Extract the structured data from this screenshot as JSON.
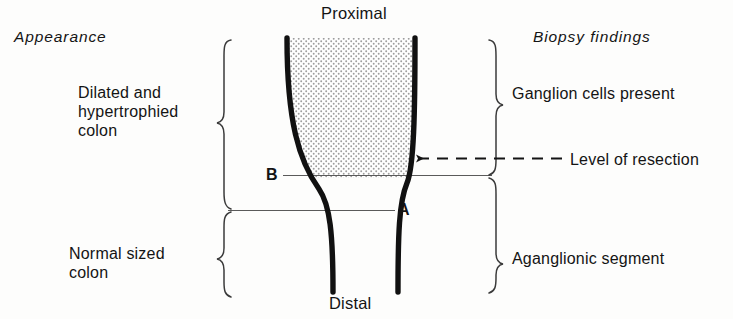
{
  "diagram": {
    "columns": {
      "left_header": "Appearance",
      "right_header": "Biopsy findings"
    },
    "orientation": {
      "top": "Proximal",
      "bottom": "Distal"
    },
    "left_labels": [
      {
        "id": "dilated",
        "text": "Dilated and\nhypertrophied\ncolon"
      },
      {
        "id": "normal",
        "text": "Normal sized\ncolon"
      }
    ],
    "right_labels": [
      {
        "id": "ganglion",
        "text": "Ganglion cells present"
      },
      {
        "id": "aganglionic",
        "text": "Aganglionic segment"
      }
    ],
    "annotations": [
      {
        "id": "resection",
        "text": "Level of resection",
        "style": "dashed-arrow-left"
      }
    ],
    "markers": [
      {
        "id": "marker-b",
        "label": "B",
        "description": "upper transition level line"
      },
      {
        "id": "marker-a",
        "label": "A",
        "description": "lower transition level line"
      }
    ],
    "colors": {
      "ink": "#141414",
      "wall": "#111111",
      "thin_line": "#5a5a5a",
      "stipple": "#9a9a9a",
      "background": "#fdfdfc"
    }
  }
}
